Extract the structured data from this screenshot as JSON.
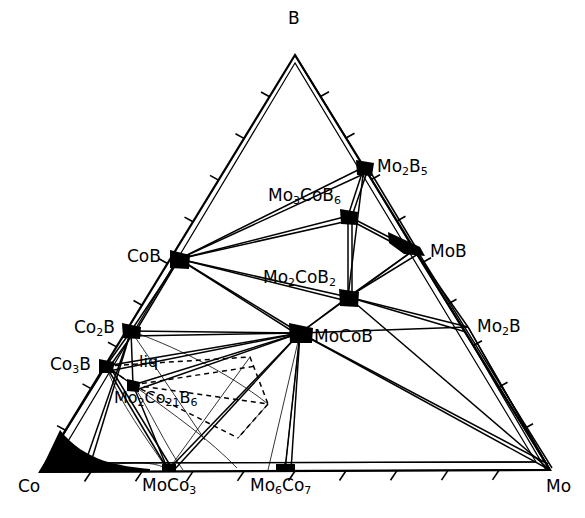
{
  "figure": {
    "type": "ternary-phase-diagram",
    "system": "B-Co-Mo",
    "background": "#ffffff",
    "line_color": "#000000"
  },
  "corners": {
    "top": {
      "label": "B",
      "x": 295,
      "y": 55,
      "label_x": 288,
      "label_y": 12
    },
    "bottom_left": {
      "label": "Co",
      "x": 40,
      "y": 472,
      "label_x": 20,
      "label_y": 480
    },
    "bottom_right": {
      "label": "Mo",
      "x": 550,
      "y": 470,
      "label_x": 548,
      "label_y": 480
    }
  },
  "phase_labels": [
    {
      "name": "Mo2B5",
      "text": "Mo",
      "sub1": "2",
      "mid": "B",
      "sub2": "5",
      "x": 377,
      "y": 159
    },
    {
      "name": "Mo3CoB6",
      "text": "Mo",
      "sub1": "3",
      "mid": "CoB",
      "sub2": "6",
      "x": 270,
      "y": 188
    },
    {
      "name": "CoB",
      "text": "CoB",
      "sub1": "",
      "mid": "",
      "sub2": "",
      "x": 128,
      "y": 248
    },
    {
      "name": "MoB",
      "text": "MoB",
      "sub1": "",
      "mid": "",
      "sub2": "",
      "x": 432,
      "y": 243
    },
    {
      "name": "Mo2CoB2",
      "text": "Mo",
      "sub1": "2",
      "mid": "CoB",
      "sub2": "2",
      "x": 265,
      "y": 271
    },
    {
      "name": "Mo2B",
      "text": "Mo",
      "sub1": "2",
      "mid": "B",
      "sub2": "",
      "x": 478,
      "y": 319
    },
    {
      "name": "Co2B",
      "text": "Co",
      "sub1": "2",
      "mid": "B",
      "sub2": "",
      "x": 76,
      "y": 320
    },
    {
      "name": "MoCoB",
      "text": "MoCoB",
      "sub1": "",
      "mid": "",
      "sub2": "",
      "x": 313,
      "y": 328
    },
    {
      "name": "Co3B",
      "text": "Co",
      "sub1": "3",
      "mid": "B",
      "sub2": "",
      "x": 52,
      "y": 357
    },
    {
      "name": "liq",
      "text": "liq",
      "sub1": "",
      "mid": "",
      "sub2": "",
      "x": 140,
      "y": 355
    },
    {
      "name": "Mo2Co21B6",
      "text": "Mo",
      "sub1": "2",
      "mid": "Co",
      "sub2": "21",
      "tail": "B",
      "sub3": "6",
      "x": 116,
      "y": 391
    },
    {
      "name": "MoCo3",
      "text": "MoCo",
      "sub1": "3",
      "mid": "",
      "sub2": "",
      "x": 144,
      "y": 478
    },
    {
      "name": "Mo6Co7",
      "text": "Mo",
      "sub1": "6",
      "mid": "Co",
      "sub2": "7",
      "x": 252,
      "y": 478
    }
  ],
  "nodes": [
    {
      "name": "B-apex",
      "x": 295,
      "y": 55,
      "filled": false
    },
    {
      "name": "Co-corner",
      "x": 40,
      "y": 472,
      "filled": true
    },
    {
      "name": "Mo-corner",
      "x": 550,
      "y": 470,
      "filled": false
    },
    {
      "name": "Mo2B5",
      "x": 364,
      "y": 167,
      "filled": true
    },
    {
      "name": "Mo3CoB6",
      "x": 348,
      "y": 216,
      "filled": true
    },
    {
      "name": "CoB",
      "x": 179,
      "y": 259,
      "filled": true
    },
    {
      "name": "MoB",
      "x": 414,
      "y": 250,
      "filled": true
    },
    {
      "name": "Mo2CoB2",
      "x": 348,
      "y": 297,
      "filled": true
    },
    {
      "name": "Mo2B",
      "x": 468,
      "y": 327,
      "filled": false
    },
    {
      "name": "Co2B",
      "x": 131,
      "y": 331,
      "filled": true
    },
    {
      "name": "MoCoB",
      "x": 300,
      "y": 333,
      "filled": true
    },
    {
      "name": "Co3B",
      "x": 106,
      "y": 366,
      "filled": true
    },
    {
      "name": "Mo2Co21B6",
      "x": 133,
      "y": 385,
      "filled": true
    },
    {
      "name": "MoCo3",
      "x": 168,
      "y": 470,
      "filled": true
    },
    {
      "name": "Mo6Co7",
      "x": 285,
      "y": 470,
      "filled": true
    }
  ],
  "axes": {
    "ticks_per_edge": 9,
    "tick_length": 9,
    "tick_style": "outward"
  }
}
